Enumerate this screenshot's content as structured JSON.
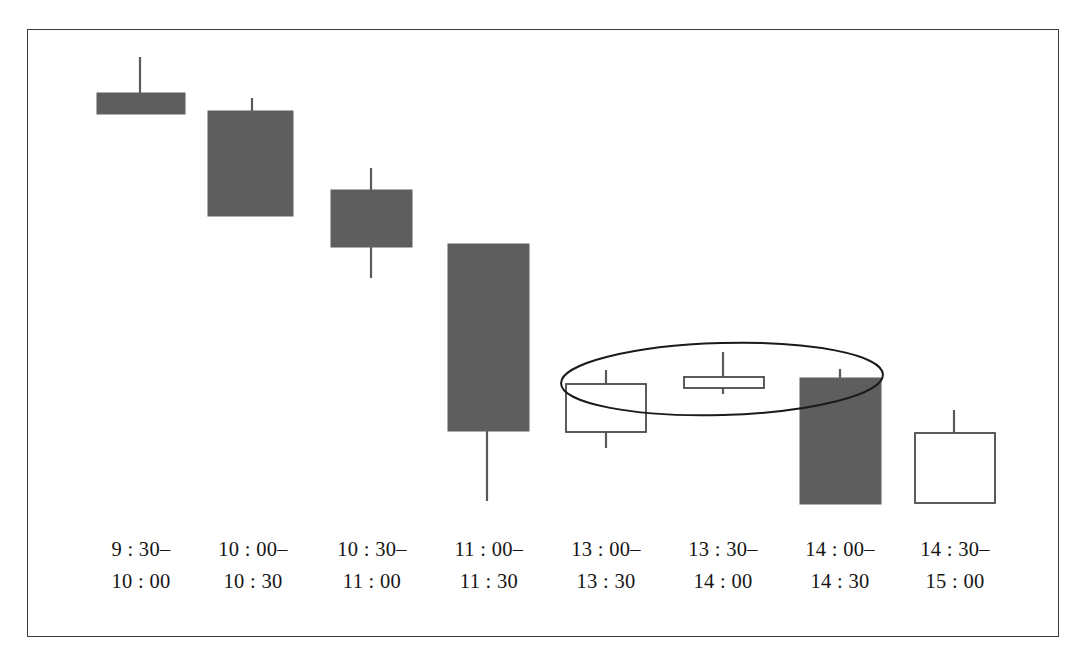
{
  "figure": {
    "frame": {
      "x": 27,
      "y": 29,
      "width": 1032,
      "height": 608,
      "stroke": "#3a3a3a",
      "stroke_width": 1.6
    },
    "background": "#ffffff"
  },
  "style": {
    "filled_body_fill": "#5e5e5e",
    "filled_body_stroke": "#5e5e5e",
    "hollow_body_fill": "#ffffff",
    "hollow_body_stroke": "#4a4a4a",
    "wick_stroke": "#5a5a5a",
    "wick_width": 2.2,
    "body_stroke_width": 1.8,
    "label_color": "#151515",
    "annotation_stroke": "#1a1a1a",
    "annotation_stroke_width": 2.0
  },
  "chart_data": {
    "type": "candlestick",
    "title": "",
    "xlabel": "",
    "ylabel": "",
    "grid": false,
    "legend": "none",
    "note": "Intraday 30-minute candlestick sequence; price axis unlabeled, values given in pixel-space units where larger y is lower price.",
    "categories": [
      "9:30-10:00",
      "10:00-10:30",
      "10:30-11:00",
      "11:00-11:30",
      "13:00-13:30",
      "13:30-14:00",
      "14:00-14:30",
      "14:30-15:00"
    ],
    "candles": [
      {
        "label_top": "9 : 30–",
        "label_bottom": "10 : 00",
        "direction": "down",
        "filled": true,
        "center_x": 140,
        "body_left": 97,
        "body_right": 185,
        "body_top": 93,
        "body_bottom": 114,
        "wick_top": 57,
        "wick_bottom": 114,
        "label_x": 141
      },
      {
        "label_top": "10 : 00–",
        "label_bottom": "10 : 30",
        "direction": "down",
        "filled": true,
        "center_x": 252,
        "body_left": 208,
        "body_right": 293,
        "body_top": 111,
        "body_bottom": 216,
        "wick_top": 98,
        "wick_bottom": 216,
        "label_x": 253
      },
      {
        "label_top": "10 : 30–",
        "label_bottom": "11 : 00",
        "direction": "down",
        "filled": true,
        "center_x": 371,
        "body_left": 331,
        "body_right": 412,
        "body_top": 190,
        "body_bottom": 247,
        "wick_top": 168,
        "wick_bottom": 278,
        "label_x": 372
      },
      {
        "label_top": "11 : 00–",
        "label_bottom": "11 : 30",
        "direction": "down",
        "filled": true,
        "center_x": 487,
        "body_left": 448,
        "body_right": 529,
        "body_top": 244,
        "body_bottom": 431,
        "wick_top": 244,
        "wick_bottom": 501,
        "label_x": 489
      },
      {
        "label_top": "13 : 00–",
        "label_bottom": "13 : 30",
        "direction": "up",
        "filled": false,
        "center_x": 606,
        "body_left": 566,
        "body_right": 646,
        "body_top": 384,
        "body_bottom": 432,
        "wick_top": 370,
        "wick_bottom": 448,
        "label_x": 606
      },
      {
        "label_top": "13 : 30–",
        "label_bottom": "14 : 00",
        "direction": "doji",
        "filled": false,
        "center_x": 723,
        "body_left": 684,
        "body_right": 764,
        "body_top": 377,
        "body_bottom": 388,
        "wick_top": 352,
        "wick_bottom": 394,
        "label_x": 723
      },
      {
        "label_top": "14 : 00–",
        "label_bottom": "14 : 30",
        "direction": "down",
        "filled": true,
        "center_x": 840,
        "body_left": 800,
        "body_right": 881,
        "body_top": 378,
        "body_bottom": 504,
        "wick_top": 369,
        "wick_bottom": 504,
        "label_x": 840
      },
      {
        "label_top": "14 : 30–",
        "label_bottom": "15 : 00",
        "direction": "up",
        "filled": false,
        "center_x": 954,
        "body_left": 915,
        "body_right": 995,
        "body_top": 433,
        "body_bottom": 503,
        "wick_top": 410,
        "wick_bottom": 503,
        "label_x": 955
      }
    ],
    "annotations": [
      {
        "kind": "ellipse",
        "name": "highlight-ellipse",
        "cx": 722,
        "cy": 379,
        "rx": 161,
        "ry": 36,
        "rotation_deg": -1.6,
        "covers": [
          "13:00-13:30",
          "13:30-14:00",
          "14:00-14:30"
        ]
      }
    ],
    "label_rows": {
      "row1_y": 556,
      "row2_y": 588
    }
  }
}
